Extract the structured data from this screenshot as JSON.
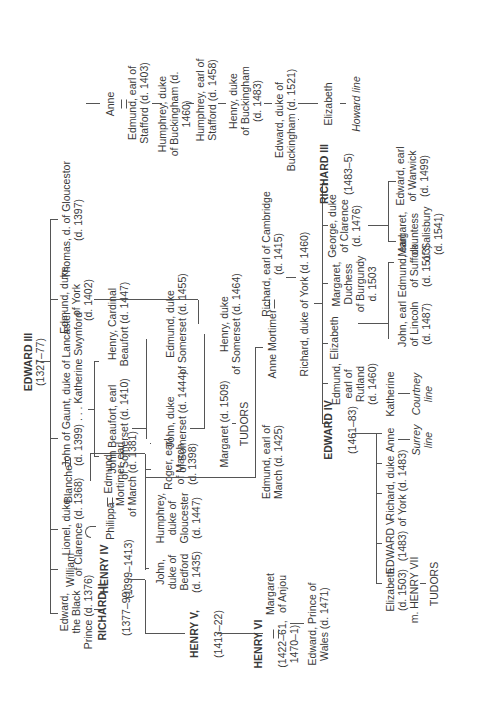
{
  "root": {
    "name": "EDWARD III",
    "dates": "(1327–77)"
  },
  "gen1": {
    "black_prince": "Edward,\nthe Black\nPrince (d. 1376)",
    "william": "William",
    "lionel": "Lionel, duke\nof Clarence (d. 1368)",
    "blanche": "Blanche",
    "gaunt": "John of Gaunt, duke of Lancaster\n(d. 1399) . . . Katherine Swynford",
    "edmund_york": "Edmund, duke\nof York\n(d. 1402)",
    "thomas": "Thomas, d. of Gloucestor\n(d. 1397)"
  },
  "gen2": {
    "richard2": {
      "name": "RICHARD II",
      "dates": "(1377–99)"
    },
    "henry4": {
      "name": "HENRY IV",
      "dates": "(1399–1413)"
    },
    "philippa": "Philippa",
    "edmund_mortimer": "Edmund\nMortimer, earl\nof March (d. 1381)",
    "john_beaufort": "John Beaufort, earl\nof Somerset (d. 1410)",
    "henry_beaufort": "Henry, Cardinal\nBeaufort (d. 1447)",
    "richard_cambridge": "Richard, earl of Cambridge\n(d. 1415)",
    "anne_stafford": "Anne",
    "edmund_stafford": "Edmund, earl of\nStafford (d. 1403)"
  },
  "gen3": {
    "henry5": {
      "name": "HENRY V,",
      "dates": "(1413–22)"
    },
    "john_bedford": "John,\nduke of\nBedford\n(d. 1435)",
    "humphrey_gloucester": "Humphrey,\nduke of\nGloucester\n(d. 1447)",
    "roger_march": "Roger, earl\nof March\n(d. 1398)",
    "john_somerset": "John, duke\nof Somerset (d. 1444)",
    "edmund_somerset": "Edmund, duke\nof Somerset (d. 1455)",
    "humphrey_buckingham": "Humphrey, duke\nof Buckingham (d. 1460)",
    "anne_mortimer": "Anne Mortimer",
    "richard_york": "Richard, duke of York (d. 1460)"
  },
  "gen4": {
    "henry6": {
      "name": "HENRY VI",
      "dates": "(1422–61,\n1470–1)"
    },
    "margaret_anjou": "Margaret\nof Anjou",
    "edmund_march": "Edmund, earl of\nMarch (d. 1425)",
    "margaret_beaufort": "Margaret (d. 1509)",
    "tudors1": "TUDORS",
    "henry_somerset": "Henry, duke\nof Somerset (d. 1464)",
    "humphrey_stafford": "Humphrey, earl of\nStafford (d. 1458)",
    "edward4": {
      "name": "EDWARD IV",
      "dates": "(1461–83)"
    },
    "edmund_rutland": "Edmund,\nearl of\nRutland\n(d. 1460)",
    "elizabeth_york": "Elizabeth",
    "margaret_burgundy": "Margaret,\nDuchess\nof Burgundy\nd. 1503",
    "george_clarence": "George, duke\nof Clarence\n(d. 1476)",
    "richard3": {
      "name": "RICHARD III",
      "dates": "(1483–5)"
    }
  },
  "gen5": {
    "edward_wales": "Edward, Prince of\nWales (d. 1471)",
    "henry_buckingham": "Henry, duke\nof Buckingham\n(d. 1483)",
    "elizabeth_of_york": "Elizabeth\n(d. 1503)\nm. HENRY VII",
    "tudors2": "TUDORS",
    "edward5": "EDWARD V\n(1483)",
    "richard_york2": "Richard, duke\nof York (d. 1483)",
    "anne": "Anne",
    "surrey_line": "Surrey\nline",
    "katherine": "Katherine",
    "courtney_line": "Courtney\nline",
    "john_lincoln": "John, earl\nof Lincoln\n(d. 1487)",
    "edmund_suffolk": "Edmund, earl\nof Suffolk\n(d. 1513)",
    "margaret_salisbury": "Margaret,\ncountess\nof Salisbury\n(d. 1541)",
    "edward_warwick": "Edward, earl\nof Warwick\n(d. 1499)",
    "edward_buckingham": "Edward, duke of\nBuckingham (d. 1521)",
    "elizabeth_howard": "Elizabeth",
    "howard_line": "Howard line"
  }
}
